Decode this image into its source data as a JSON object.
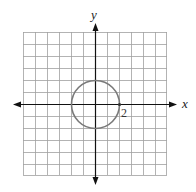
{
  "diagram": {
    "type": "coordinate-plane",
    "x_axis_label": "x",
    "y_axis_label": "y",
    "grid": {
      "columns": 12,
      "rows": 12,
      "min": -6,
      "max": 6
    },
    "circle": {
      "center": [
        0,
        0
      ],
      "radius": 2,
      "color": "#7a7a7a"
    },
    "point_label": "2",
    "colors": {
      "grid": "#9a9a9a",
      "axis": "#111111",
      "background": "#ffffff"
    }
  }
}
